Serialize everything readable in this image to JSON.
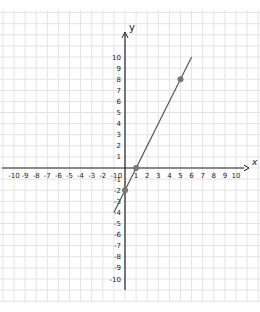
{
  "chart_data": {
    "type": "line",
    "title": "",
    "xlabel": "x",
    "ylabel": "y",
    "xlim": [
      -10,
      10
    ],
    "ylim": [
      -10,
      10
    ],
    "grid": true,
    "x_ticks": [
      -10,
      -9,
      -8,
      -7,
      -6,
      -5,
      -4,
      -3,
      -2,
      -1,
      0,
      1,
      2,
      3,
      4,
      5,
      6,
      7,
      8,
      9,
      10
    ],
    "y_ticks": [
      -10,
      -9,
      -8,
      -7,
      -6,
      -5,
      -4,
      -3,
      -2,
      -1,
      1,
      2,
      3,
      4,
      5,
      6,
      7,
      8,
      9,
      10
    ],
    "series": [
      {
        "name": "y = 2x - 2",
        "equation": "y = 2x - 2",
        "x": [
          -1,
          6.0
        ],
        "y": [
          -4,
          10
        ],
        "color": "#555555"
      }
    ],
    "points": [
      {
        "x": 0,
        "y": -2
      },
      {
        "x": 1,
        "y": 0
      },
      {
        "x": 5,
        "y": 8
      }
    ],
    "point_color": "#777777"
  },
  "labels": {
    "x_axis": "x",
    "y_axis": "y"
  }
}
